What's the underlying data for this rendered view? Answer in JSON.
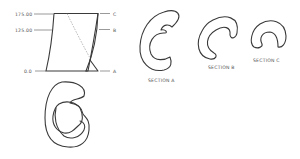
{
  "diagram": {
    "elevation": {
      "level_labels": [
        "175.00",
        "125.00",
        "0.0"
      ],
      "section_markers": [
        "C",
        "B",
        "A"
      ]
    },
    "sections": [
      {
        "id": "A",
        "label": "SECTION A"
      },
      {
        "id": "B",
        "label": "SECTION B"
      },
      {
        "id": "C",
        "label": "SECTION C"
      }
    ],
    "colors": {
      "line": "#3a3a3a",
      "text": "#555555",
      "background": "#ffffff"
    }
  }
}
